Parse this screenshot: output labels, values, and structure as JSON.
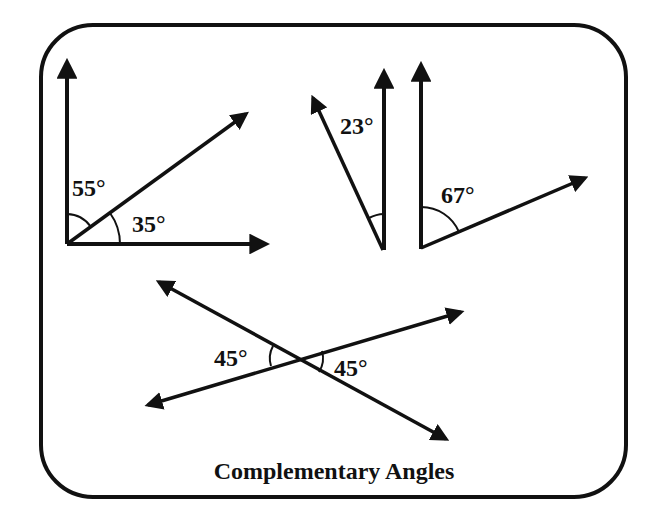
{
  "title": "Complementary Angles",
  "colors": {
    "background": "#ffffff",
    "stroke": "#111111"
  },
  "frame": {
    "x": 41,
    "y": 25,
    "width": 585,
    "height": 472,
    "radius": 52
  },
  "figures": [
    {
      "id": "fig1",
      "description": "Right angle split by a ray into 55 and 35 degrees",
      "vertex": [
        67,
        244
      ],
      "rays": [
        [
          67,
          56
        ],
        [
          273,
          244
        ],
        [
          252,
          110
        ]
      ],
      "arcs": [
        {
          "label": "55°",
          "label_pos": [
            72,
            196
          ]
        },
        {
          "label": "35°",
          "label_pos": [
            132,
            232
          ]
        }
      ]
    },
    {
      "id": "fig2",
      "description": "Angle of 23 degrees",
      "vertex": [
        383,
        250
      ],
      "rays": [
        [
          384,
          66
        ],
        [
          310,
          92
        ]
      ],
      "arcs": [
        {
          "label": "23°",
          "label_pos": [
            340,
            134
          ]
        }
      ]
    },
    {
      "id": "fig3",
      "description": "Angle of 67 degrees",
      "vertex": [
        421,
        248
      ],
      "rays": [
        [
          421,
          59
        ],
        [
          592,
          175
        ]
      ],
      "arcs": [
        {
          "label": "67°",
          "label_pos": [
            441,
            203
          ]
        }
      ]
    },
    {
      "id": "fig4",
      "description": "Two intersecting lines forming vertical 45 degree angles",
      "intersection": [
        296,
        359
      ],
      "lines": [
        [
          [
            153,
            279
          ],
          [
            452,
            442
          ]
        ],
        [
          [
            142,
            407
          ],
          [
            467,
            310
          ]
        ]
      ],
      "arcs": [
        {
          "label": "45°",
          "label_pos": [
            214,
            366
          ]
        },
        {
          "label": "45°",
          "label_pos": [
            334,
            376
          ]
        }
      ]
    }
  ],
  "labels": {
    "fig1_top": "55°",
    "fig1_bottom": "35°",
    "fig2": "23°",
    "fig3": "67°",
    "fig4_left": "45°",
    "fig4_right": "45°"
  }
}
